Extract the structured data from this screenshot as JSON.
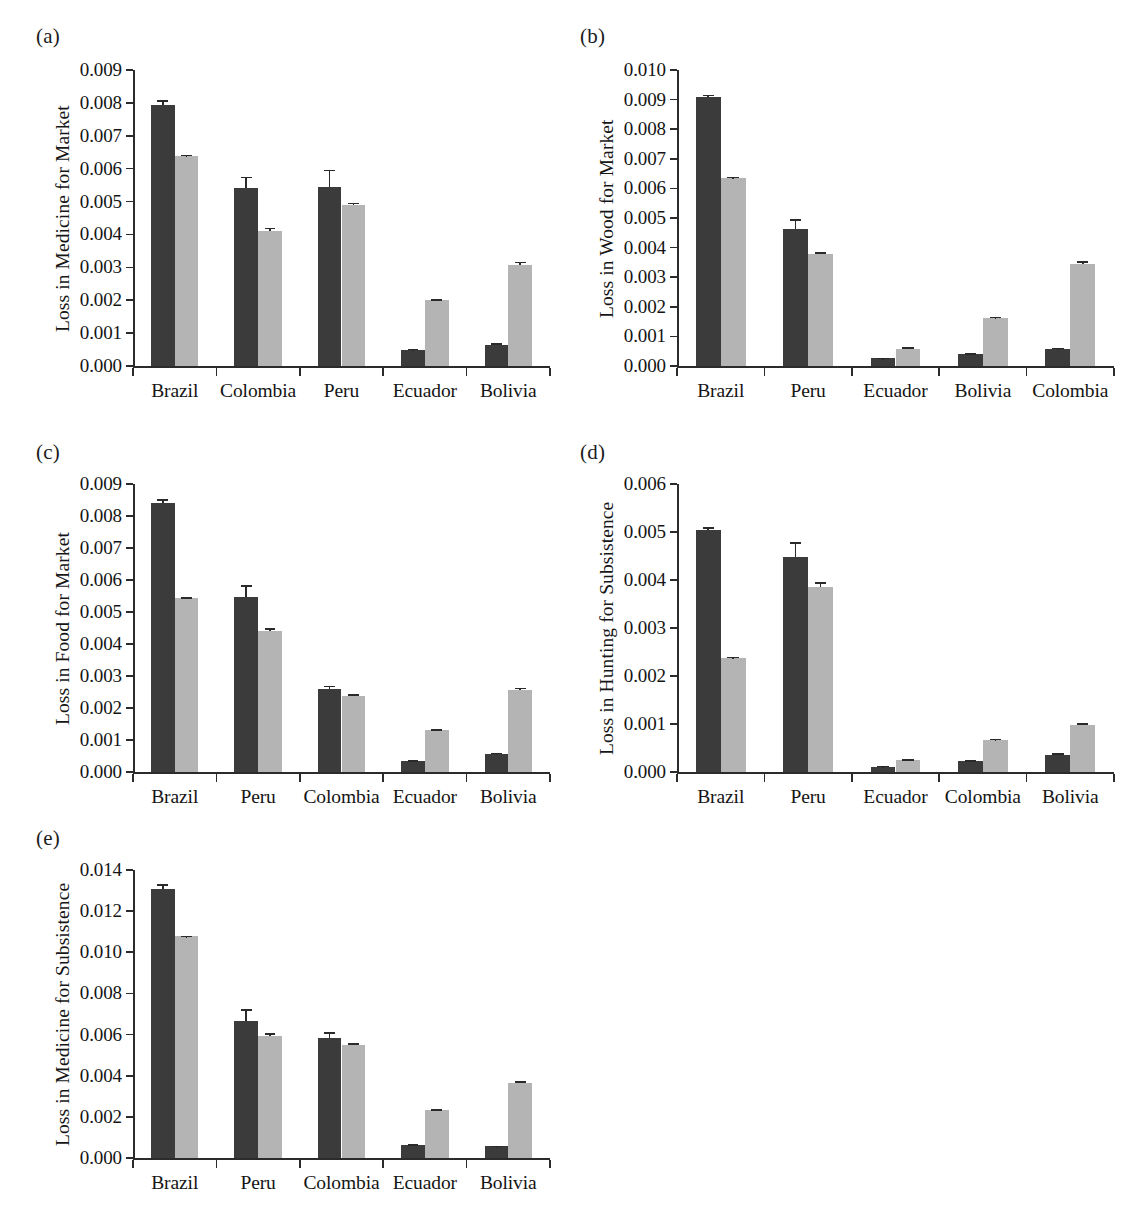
{
  "figure": {
    "panel_labels": [
      "(a)",
      "(b)",
      "(c)",
      "(d)",
      "(e)"
    ],
    "series_colors": {
      "dark": "#3b3b3b",
      "light": "#b4b4b4"
    }
  },
  "chart_data": [
    {
      "type": "bar",
      "panel": "(a)",
      "title": "",
      "xlabel": "",
      "ylabel": "Loss in Medicine for Market",
      "categories": [
        "Brazil",
        "Colombia",
        "Peru",
        "Ecuador",
        "Bolivia"
      ],
      "ylim": [
        0.0,
        0.009
      ],
      "ytick_labels": [
        "0.000",
        "0.001",
        "0.002",
        "0.003",
        "0.004",
        "0.005",
        "0.006",
        "0.007",
        "0.008",
        "0.009"
      ],
      "ytick_values": [
        0.0,
        0.001,
        0.002,
        0.003,
        0.004,
        0.005,
        0.006,
        0.007,
        0.008,
        0.009
      ],
      "grid": false,
      "legend": "none",
      "series": [
        {
          "name": "dark",
          "values": [
            0.00795,
            0.0054,
            0.00544,
            0.00048,
            0.00065
          ],
          "errors": [
            0.00013,
            0.00036,
            0.00053,
            4e-05,
            4e-05
          ]
        },
        {
          "name": "light",
          "values": [
            0.0064,
            0.0041,
            0.00491,
            0.002,
            0.00308
          ],
          "errors": [
            2e-05,
            0.00011,
            6e-05,
            3e-05,
            9e-05
          ]
        }
      ]
    },
    {
      "type": "bar",
      "panel": "(b)",
      "title": "",
      "xlabel": "",
      "ylabel": "Loss in Wood for Market",
      "categories": [
        "Brazil",
        "Peru",
        "Ecuador",
        "Bolivia",
        "Colombia"
      ],
      "ylim": [
        0.0,
        0.01
      ],
      "ytick_labels": [
        "0.000",
        "0.001",
        "0.002",
        "0.003",
        "0.004",
        "0.005",
        "0.006",
        "0.007",
        "0.008",
        "0.009",
        "0.010"
      ],
      "ytick_values": [
        0.0,
        0.001,
        0.002,
        0.003,
        0.004,
        0.005,
        0.006,
        0.007,
        0.008,
        0.009,
        0.01
      ],
      "grid": false,
      "legend": "none",
      "series": [
        {
          "name": "dark",
          "values": [
            0.00908,
            0.00463,
            0.00026,
            0.00041,
            0.00057
          ],
          "errors": [
            9e-05,
            0.00032,
            2e-05,
            2e-05,
            5e-05
          ]
        },
        {
          "name": "light",
          "values": [
            0.00635,
            0.00379,
            0.00059,
            0.00162,
            0.00344
          ],
          "errors": [
            4e-05,
            5e-05,
            4e-05,
            4e-05,
            0.00011
          ]
        }
      ]
    },
    {
      "type": "bar",
      "panel": "(c)",
      "title": "",
      "xlabel": "",
      "ylabel": "Loss in Food for Market",
      "categories": [
        "Brazil",
        "Peru",
        "Colombia",
        "Ecuador",
        "Bolivia"
      ],
      "ylim": [
        0.0,
        0.009
      ],
      "ytick_labels": [
        "0.000",
        "0.001",
        "0.002",
        "0.003",
        "0.004",
        "0.005",
        "0.006",
        "0.007",
        "0.008",
        "0.009"
      ],
      "ytick_values": [
        0.0,
        0.001,
        0.002,
        0.003,
        0.004,
        0.005,
        0.006,
        0.007,
        0.008,
        0.009
      ],
      "grid": false,
      "legend": "none",
      "series": [
        {
          "name": "dark",
          "values": [
            0.00842,
            0.00546,
            0.00258,
            0.00033,
            0.00057
          ],
          "errors": [
            0.00011,
            0.00038,
            0.00012,
            3e-05,
            3e-05
          ]
        },
        {
          "name": "light",
          "values": [
            0.00543,
            0.00441,
            0.00239,
            0.00131,
            0.00255
          ],
          "errors": [
            3e-05,
            9e-05,
            5e-05,
            3e-05,
            9e-05
          ]
        }
      ]
    },
    {
      "type": "bar",
      "panel": "(d)",
      "title": "",
      "xlabel": "",
      "ylabel": "Loss in Hunting for Subsistence",
      "categories": [
        "Brazil",
        "Peru",
        "Ecuador",
        "Colombia",
        "Bolivia"
      ],
      "ylim": [
        0.0,
        0.006
      ],
      "ytick_labels": [
        "0.000",
        "0.001",
        "0.002",
        "0.003",
        "0.004",
        "0.005",
        "0.006"
      ],
      "ytick_values": [
        0.0,
        0.001,
        0.002,
        0.003,
        0.004,
        0.005,
        0.006
      ],
      "grid": false,
      "legend": "none",
      "series": [
        {
          "name": "dark",
          "values": [
            0.00505,
            0.00448,
            0.00011,
            0.00023,
            0.00036
          ],
          "errors": [
            5e-05,
            0.00031,
            2e-05,
            2e-05,
            3e-05
          ]
        },
        {
          "name": "light",
          "values": [
            0.00237,
            0.00386,
            0.00025,
            0.00066,
            0.00097
          ],
          "errors": [
            3e-05,
            9e-05,
            2e-05,
            3e-05,
            5e-05
          ]
        }
      ]
    },
    {
      "type": "bar",
      "panel": "(e)",
      "title": "",
      "xlabel": "",
      "ylabel": "Loss in Medicine for Subsistence",
      "categories": [
        "Brazil",
        "Peru",
        "Colombia",
        "Ecuador",
        "Bolivia"
      ],
      "ylim": [
        0.0,
        0.014
      ],
      "ytick_labels": [
        "0.000",
        "0.002",
        "0.004",
        "0.006",
        "0.008",
        "0.010",
        "0.012",
        "0.014"
      ],
      "ytick_values": [
        0.0,
        0.002,
        0.004,
        0.006,
        0.008,
        0.01,
        0.012,
        0.014
      ],
      "grid": false,
      "legend": "none",
      "series": [
        {
          "name": "dark",
          "values": [
            0.01308,
            0.00668,
            0.00585,
            0.00062,
            0.00057
          ],
          "errors": [
            0.00022,
            0.00055,
            0.00027,
            4e-05,
            3e-05
          ]
        },
        {
          "name": "light",
          "values": [
            0.01078,
            0.00594,
            0.0055,
            0.00231,
            0.00366
          ],
          "errors": [
            3e-05,
            0.00012,
            8e-05,
            5e-05,
            7e-05
          ]
        }
      ]
    }
  ]
}
